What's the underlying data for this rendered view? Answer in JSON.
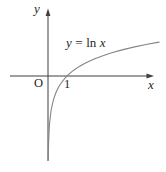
{
  "labels": {
    "y_axis": "y",
    "x_axis": "x",
    "origin": "O",
    "x_tick_1": "1"
  },
  "curve_label": {
    "text": "y = ln x",
    "parts": [
      "y",
      "=",
      "ln",
      "x"
    ]
  },
  "colors": {
    "background": "#ffffff",
    "axis": "#3f3f3f",
    "curve": "#858585",
    "text": "#1f1f1f"
  },
  "chart_data": {
    "type": "line",
    "title": "",
    "xlabel": "x",
    "ylabel": "y",
    "grid": false,
    "legend": "none",
    "x_ticks": [
      {
        "value": 1,
        "label": "1"
      }
    ],
    "x_intercept": 1,
    "asymptote": "x = 0 (negative y-axis)",
    "xlim": [
      0,
      6
    ],
    "ylim": [
      -4.4,
      2
    ],
    "series": [
      {
        "name": "y = ln x",
        "points": [
          {
            "x": 0.013,
            "y": -4.343
          },
          {
            "x": 0.02,
            "y": -3.912
          },
          {
            "x": 0.03,
            "y": -3.507
          },
          {
            "x": 0.045,
            "y": -3.101
          },
          {
            "x": 0.065,
            "y": -2.733
          },
          {
            "x": 0.09,
            "y": -2.408
          },
          {
            "x": 0.12,
            "y": -2.12
          },
          {
            "x": 0.16,
            "y": -1.833
          },
          {
            "x": 0.21,
            "y": -1.561
          },
          {
            "x": 0.27,
            "y": -1.309
          },
          {
            "x": 0.35,
            "y": -1.05
          },
          {
            "x": 0.45,
            "y": -0.799
          },
          {
            "x": 0.57,
            "y": -0.562
          },
          {
            "x": 0.72,
            "y": -0.329
          },
          {
            "x": 0.9,
            "y": -0.105
          },
          {
            "x": 1.0,
            "y": 0
          },
          {
            "x": 1.1,
            "y": 0.095
          },
          {
            "x": 1.35,
            "y": 0.3
          },
          {
            "x": 1.65,
            "y": 0.501
          },
          {
            "x": 2.0,
            "y": 0.693
          },
          {
            "x": 2.4,
            "y": 0.875
          },
          {
            "x": 2.85,
            "y": 1.047
          },
          {
            "x": 3.35,
            "y": 1.209
          },
          {
            "x": 3.9,
            "y": 1.361
          },
          {
            "x": 4.5,
            "y": 1.504
          },
          {
            "x": 5.15,
            "y": 1.639
          },
          {
            "x": 5.85,
            "y": 1.766
          }
        ]
      }
    ]
  }
}
